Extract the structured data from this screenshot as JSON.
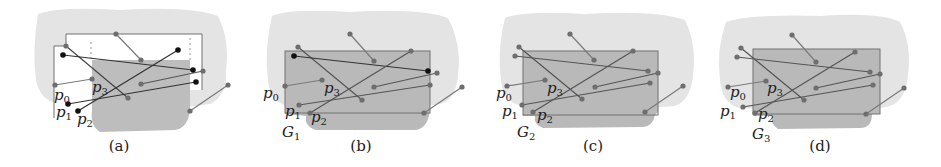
{
  "figure": {
    "colors": {
      "outer_region": "#e4e4e4",
      "inner_region": "#bdbdbd",
      "rect_fill_b_d": "#b4b4b4",
      "rect_stroke": "#707070",
      "segment_gray": "#7a7a7a",
      "segment_black": "#1a1a1a",
      "dot_gray": "#6e6e6e",
      "dot_black": "#111111"
    },
    "panels": [
      {
        "id": "a",
        "caption": "(a)",
        "group_label": "",
        "labels": {
          "p0": "p",
          "p0_sub": "0",
          "p1": "p",
          "p1_sub": "1",
          "p2": "p",
          "p2_sub": "2",
          "p3": "p",
          "p3_sub": "3"
        }
      },
      {
        "id": "b",
        "caption": "(b)",
        "group_label": "G",
        "group_sub": "1",
        "labels": {
          "p0": "p",
          "p0_sub": "0",
          "p1": "p",
          "p1_sub": "1",
          "p2": "p",
          "p2_sub": "2",
          "p3": "p",
          "p3_sub": "3"
        }
      },
      {
        "id": "c",
        "caption": "(c)",
        "group_label": "G",
        "group_sub": "2",
        "labels": {
          "p0": "p",
          "p0_sub": "0",
          "p1": "p",
          "p1_sub": "1",
          "p2": "p",
          "p2_sub": "2",
          "p3": "p",
          "p3_sub": "3"
        }
      },
      {
        "id": "d",
        "caption": "(d)",
        "group_label": "G",
        "group_sub": "3",
        "labels": {
          "p0": "p",
          "p0_sub": "0",
          "p1": "p",
          "p1_sub": "1",
          "p2": "p",
          "p2_sub": "2",
          "p3": "p",
          "p3_sub": "3"
        }
      }
    ]
  }
}
